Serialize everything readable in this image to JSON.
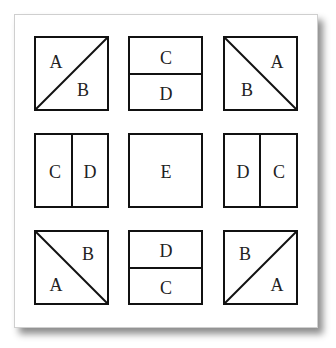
{
  "diagram": {
    "line_color": "#111111",
    "background": "#ffffff",
    "tiles": [
      {
        "position": "top-left",
        "split": "diagonal-up",
        "labels": [
          "A",
          "B"
        ]
      },
      {
        "position": "top-center",
        "split": "horizontal",
        "labels": [
          "C",
          "D"
        ]
      },
      {
        "position": "top-right",
        "split": "diagonal-down",
        "labels": [
          "A",
          "B"
        ]
      },
      {
        "position": "middle-left",
        "split": "vertical",
        "labels": [
          "C",
          "D"
        ]
      },
      {
        "position": "center",
        "split": "none",
        "labels": [
          "E"
        ]
      },
      {
        "position": "middle-right",
        "split": "vertical",
        "labels": [
          "D",
          "C"
        ]
      },
      {
        "position": "bottom-left",
        "split": "diagonal-down",
        "labels": [
          "B",
          "A"
        ]
      },
      {
        "position": "bottom-center",
        "split": "horizontal",
        "labels": [
          "D",
          "C"
        ]
      },
      {
        "position": "bottom-right",
        "split": "diagonal-up",
        "labels": [
          "B",
          "A"
        ]
      }
    ]
  }
}
